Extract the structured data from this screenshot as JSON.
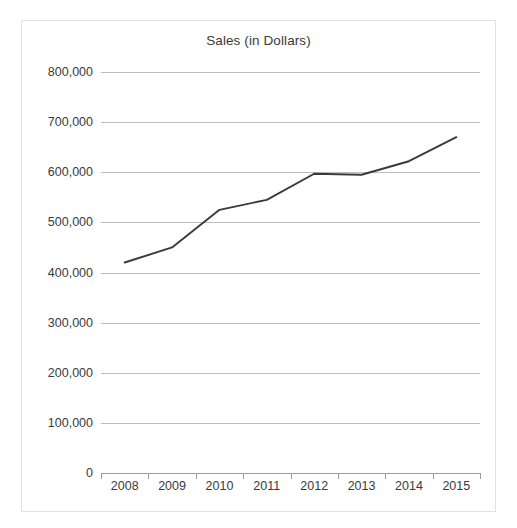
{
  "top_caption": "",
  "chart_data": {
    "type": "line",
    "title": "Sales (in Dollars)",
    "xlabel": "",
    "ylabel": "",
    "categories": [
      "2008",
      "2009",
      "2010",
      "2011",
      "2012",
      "2013",
      "2014",
      "2015"
    ],
    "x": [
      2008,
      2009,
      2010,
      2011,
      2012,
      2013,
      2014,
      2015
    ],
    "series": [
      {
        "name": "Sales",
        "color": "#3a3a3a",
        "values": [
          420000,
          450000,
          525000,
          545000,
          597000,
          595000,
          622000,
          670000
        ]
      }
    ],
    "ylim": [
      0,
      800000
    ],
    "yticks": [
      0,
      100000,
      200000,
      300000,
      400000,
      500000,
      600000,
      700000,
      800000
    ],
    "ytick_labels": [
      "0",
      "100,000",
      "200,000",
      "300,000",
      "400,000",
      "500,000",
      "600,000",
      "700,000",
      "800,000"
    ],
    "grid": true,
    "legend": "none",
    "line_color": "#3a3a3a",
    "grid_color": "#bdbdbd",
    "axis_color": "#9c9c9c",
    "border_color": "#e2e2e4",
    "background": "#ffffff"
  }
}
